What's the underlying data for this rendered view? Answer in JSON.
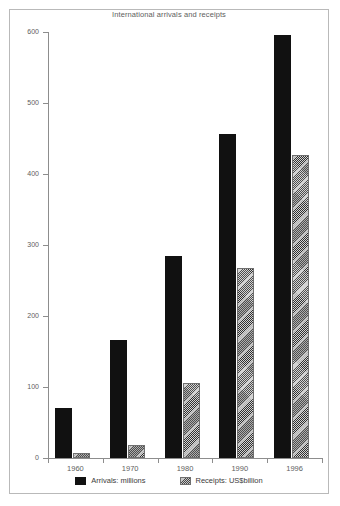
{
  "chart_data": {
    "type": "bar",
    "title": "International arrivals and receipts",
    "xlabel": "",
    "ylabel": "",
    "categories": [
      "1960",
      "1970",
      "1980",
      "1990",
      "1996"
    ],
    "series": [
      {
        "name": "Arrivals: millions",
        "values": [
          70,
          166,
          285,
          456,
          596
        ],
        "color": "#111111",
        "fill": "solid"
      },
      {
        "name": "Receipts: US$billion",
        "values": [
          7,
          19,
          106,
          268,
          427
        ],
        "color": "#9a9a9a",
        "fill": "hatched"
      }
    ],
    "ylim": [
      0,
      600
    ],
    "yticks": [
      0,
      100,
      200,
      300,
      400,
      500,
      600
    ],
    "ytick_labels": [
      "0",
      "100",
      "200",
      "300",
      "400",
      "500",
      "600"
    ],
    "grid": false,
    "legend_position": "bottom"
  },
  "legend": {
    "entries": [
      {
        "label": "Arrivals: millions"
      },
      {
        "label": "Receipts: US$billion"
      }
    ]
  }
}
